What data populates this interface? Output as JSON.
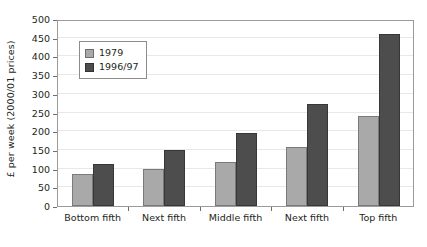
{
  "chart_data": {
    "type": "bar",
    "title": "",
    "xlabel": "",
    "ylabel": "£ per week (2000/01 prices)",
    "categories": [
      "Bottom fifth",
      "Next fifth",
      "Middle fifth",
      "Next fifth",
      "Top fifth"
    ],
    "series": [
      {
        "name": "1979",
        "color": "#a9a9a9",
        "values": [
          85,
          100,
          119,
          158,
          240
        ]
      },
      {
        "name": "1996/97",
        "color": "#4d4d4d",
        "values": [
          112,
          150,
          194,
          272,
          460
        ]
      }
    ],
    "ylim": [
      0,
      500
    ],
    "ytick_step": 50,
    "yticks": [
      0,
      50,
      100,
      150,
      200,
      250,
      300,
      350,
      400,
      450,
      500
    ],
    "ytick_labels": [
      "0",
      "50",
      "100",
      "150",
      "200",
      "250",
      "300",
      "350",
      "400",
      "450",
      "500"
    ],
    "grid": true,
    "legend_position": "upper left"
  }
}
